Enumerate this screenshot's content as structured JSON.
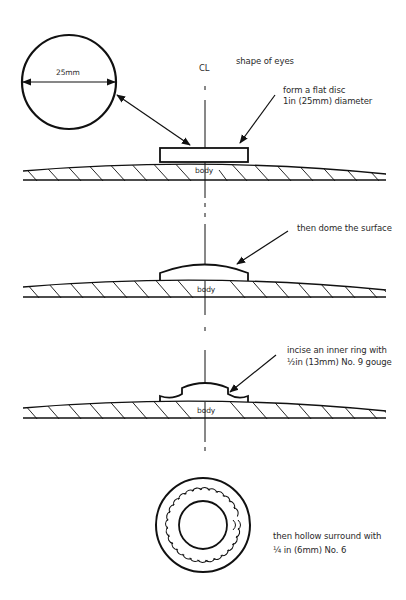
{
  "title": "shape of eyes",
  "centerline_label": "CL",
  "stages": [
    {
      "step": 1,
      "annotation_lines": [
        "form a flat disc",
        "1in (25mm) diameter"
      ],
      "body_label": "body"
    },
    {
      "step": 2,
      "annotation_lines": [
        "then dome the surface"
      ],
      "body_label": "body"
    },
    {
      "step": 3,
      "annotation_lines": [
        "incise an inner ring with",
        "½in (13mm) No. 9 gouge"
      ],
      "body_label": "body"
    },
    {
      "step": 4,
      "annotation_lines": [
        "then hollow surround with",
        "¼  in (6mm) No. 6"
      ]
    }
  ],
  "detail_circle": {
    "dimension_label": "25mm"
  },
  "colors": {
    "line": "#111111",
    "text": "#2a2a2a",
    "background": "#ffffff"
  }
}
